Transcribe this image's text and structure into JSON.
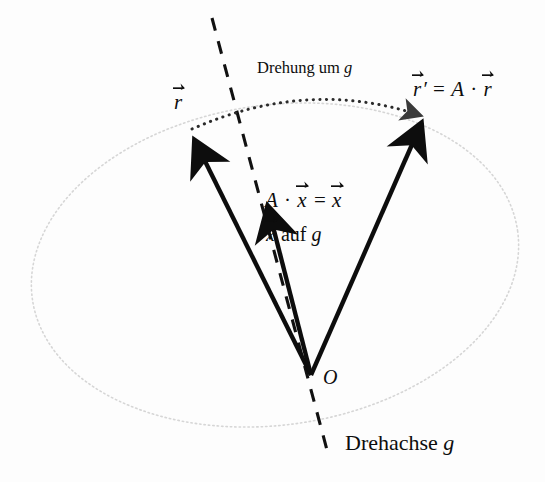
{
  "figure": {
    "background_color": "#fdfdfd",
    "ink_color": "#0d0d0d",
    "faint_color": "#d8d8d8"
  },
  "labels": {
    "rotation_arc": {
      "text_plain": "Drehung um",
      "italic_symbol": "g",
      "full": "Drehung um g"
    },
    "vector_r": {
      "symbol": "r",
      "full": "r⃗"
    },
    "vector_r_prime_equation": {
      "lhs_symbol": "r",
      "prime": "′",
      "equals": "=",
      "matrix": "A",
      "dot": "·",
      "rhs_symbol": "r",
      "full": "r⃗′ = A · r⃗"
    },
    "eigen_equation": {
      "matrix": "A",
      "dot": "·",
      "vector": "x",
      "equals": "=",
      "result": "x",
      "full": "A · x⃗ = x⃗"
    },
    "x_on_g": {
      "vector": "x",
      "text_plain": "auf",
      "italic_symbol": "g",
      "full": "x⃗ auf g"
    },
    "origin": {
      "symbol": "O"
    },
    "rotation_axis": {
      "text_plain": "Drehachse",
      "italic_symbol": "g",
      "full": "Drehachse g"
    }
  },
  "geometry": {
    "origin_point": {
      "x": 311,
      "y": 375
    },
    "vectors": [
      {
        "name": "r",
        "tip_x": 188,
        "tip_y": 130
      },
      {
        "name": "x",
        "tip_x": 262,
        "tip_y": 196
      },
      {
        "name": "r-prime",
        "tip_x": 425,
        "tip_y": 112
      }
    ],
    "axis_line": {
      "x1": 212,
      "y1": 18,
      "x2": 327,
      "y2": 450
    },
    "rotation_arc": {
      "from_x": 190,
      "from_y": 128,
      "to_x": 424,
      "to_y": 114
    },
    "ellipse": {
      "cx": 275,
      "cy": 265,
      "rx": 245,
      "ry": 160,
      "rotation_deg": -8
    }
  }
}
